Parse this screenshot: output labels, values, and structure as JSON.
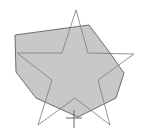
{
  "diagram": {
    "width": 149,
    "height": 138,
    "background": "#ffffff",
    "polygon": {
      "fill": "#c8c8c8",
      "stroke": "#6e6e6e",
      "points": "15,35 89,25 110,53 124,73 116,98 78,117 36,98 16,72"
    },
    "star": {
      "fill": "none",
      "stroke": "#7a7a7a",
      "points": "76,10 88,53 134,54 98,80 110,125 75,98 38,125 52,80 17,53 62,53"
    },
    "cross_mark": {
      "stroke": "#555555",
      "vertical": {
        "x1": 74,
        "y1": 110,
        "x2": 74,
        "y2": 128
      },
      "horizontal": {
        "x1": 66,
        "y1": 118,
        "x2": 82,
        "y2": 118
      }
    }
  }
}
